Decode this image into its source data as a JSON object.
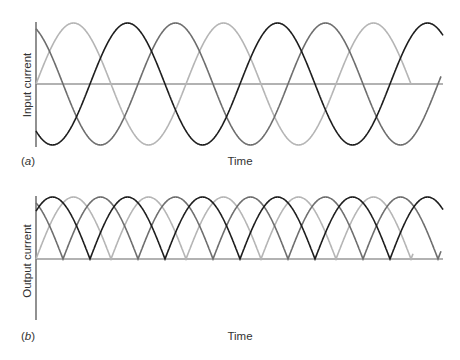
{
  "chart_data": [
    {
      "panel": "a",
      "type": "line",
      "title": "",
      "panel_label": "(a)",
      "xlabel": "Time",
      "ylabel": "Input current",
      "grid": false,
      "legend": null,
      "description": "Three-phase sinusoidal input currents, 120° apart",
      "period_px": 150,
      "series": [
        {
          "name": "phase-1 (light)",
          "color": "#b5b5b5",
          "function": "sin",
          "zero_rising_at_px": 36,
          "x_range_px": [
            36,
            411
          ]
        },
        {
          "name": "phase-2 (medium)",
          "color": "#6e6e6e",
          "function": "-sin",
          "zero_falling_at_px": 63,
          "x_range_px": [
            36,
            441
          ]
        },
        {
          "name": "phase-3 (dark)",
          "color": "#1e1e1e",
          "function": "sin",
          "zero_rising_at_px": 90,
          "x_range_px": [
            36,
            443
          ]
        }
      ],
      "ylim": [
        -1,
        1
      ],
      "x_cycles_shown": 2.7
    },
    {
      "panel": "b",
      "type": "line",
      "title": "",
      "panel_label": "(b)",
      "xlabel": "Time",
      "ylabel": "Output current",
      "grid": false,
      "legend": null,
      "description": "Full-wave rectified outputs |i| of the three phases",
      "period_px": 150,
      "series": [
        {
          "name": "phase-1 rectified (light)",
          "color": "#b5b5b5",
          "function": "|sin|",
          "zero_rising_at_px": 36,
          "x_range_px": [
            36,
            413
          ]
        },
        {
          "name": "phase-2 rectified (medium)",
          "color": "#6e6e6e",
          "function": "|sin|",
          "zero_falling_at_px": 63,
          "x_range_px": [
            36,
            441
          ]
        },
        {
          "name": "phase-3 rectified (dark)",
          "color": "#1e1e1e",
          "function": "|sin|",
          "zero_rising_at_px": 90,
          "x_range_px": [
            36,
            443
          ]
        }
      ],
      "ylim": [
        -1,
        1
      ]
    }
  ],
  "panels": {
    "a": {
      "label": "(a)",
      "ylabel": "Input current",
      "xlabel": "Time"
    },
    "b": {
      "label": "(b)",
      "ylabel": "Output current",
      "xlabel": "Time"
    }
  },
  "layout": {
    "a": {
      "axis_x": 36,
      "y_top": 22,
      "y_bottom": 147,
      "zero_y": 84,
      "amp": 61,
      "x_end": 443
    },
    "b": {
      "axis_x": 36,
      "y_top": 196,
      "y_bottom": 320,
      "zero_y": 259,
      "amp": 62,
      "x_end": 443
    }
  },
  "colors": {
    "axis": "#555555",
    "zero_line": "#666666",
    "light": "#b5b5b5",
    "medium": "#6e6e6e",
    "dark": "#1e1e1e"
  }
}
